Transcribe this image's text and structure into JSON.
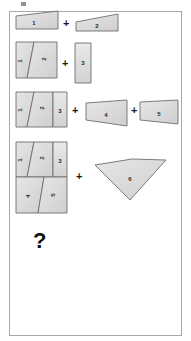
{
  "document": {
    "title": "Geometric dissection puzzle",
    "background_color": "#ffffff",
    "frame_border_color": "#a8a8a8",
    "piece_fill_color": "#d9d9d9",
    "piece_stroke_color": "#6e6e6e",
    "label_color": "#2b2b2b"
  },
  "operators": {
    "plus": "+",
    "question": "?"
  },
  "rows": [
    {
      "id": "row-1",
      "operands": [
        {
          "piece": "1",
          "shape": "right-trapezoid"
        },
        {
          "piece": "2",
          "shape": "right-trapezoid"
        }
      ],
      "operator": "+"
    },
    {
      "id": "row-2",
      "operands": [
        {
          "piece": "1",
          "shape": "assembled-quadrilateral-left"
        },
        {
          "piece": "2",
          "shape": "assembled-quadrilateral-right"
        },
        {
          "piece": "3",
          "shape": "tall-rectangle"
        }
      ],
      "operator": "+"
    },
    {
      "id": "row-3",
      "operands": [
        {
          "piece": "1",
          "shape": "assembled-left"
        },
        {
          "piece": "2",
          "shape": "assembled-middle"
        },
        {
          "piece": "3",
          "shape": "assembled-right-strip"
        },
        {
          "piece": "4",
          "shape": "quadrilateral"
        },
        {
          "piece": "5",
          "shape": "quadrilateral"
        }
      ],
      "operator": "+"
    },
    {
      "id": "row-4",
      "operands": [
        {
          "piece": "1",
          "shape": "assembled-top-left"
        },
        {
          "piece": "2",
          "shape": "assembled-top-middle"
        },
        {
          "piece": "3",
          "shape": "assembled-top-right"
        },
        {
          "piece": "4",
          "shape": "assembled-bottom-left"
        },
        {
          "piece": "5",
          "shape": "assembled-bottom-right"
        },
        {
          "piece": "6",
          "shape": "parallelogram"
        }
      ],
      "operator": "+"
    },
    {
      "id": "row-5",
      "operands": [],
      "operator": "?"
    }
  ],
  "labels": {
    "r1_p1": "1",
    "r1_p2": "2",
    "r2_p1": "1",
    "r2_p2": "2",
    "r2_p3": "3",
    "r3_p1": "1",
    "r3_p2": "2",
    "r3_p3": "3",
    "r3_p4": "4",
    "r3_p5": "5",
    "r4_p1": "1",
    "r4_p2": "2",
    "r4_p3": "3",
    "r4_p4": "4",
    "r4_p5": "5",
    "r4_p6": "6"
  },
  "plus_signs": {
    "row1": "+",
    "row2": "+",
    "row3a": "+",
    "row3b": "+",
    "row4": "+"
  }
}
